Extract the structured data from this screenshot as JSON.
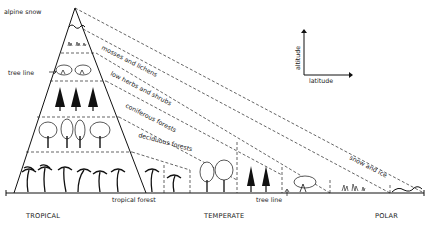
{
  "diagram": {
    "title_labels": {
      "peak": "alpine snow",
      "tree_line_left": "tree line",
      "tree_line_bottom": "tree line",
      "ground_label": "tropical forest"
    },
    "zones": [
      {
        "label": "mosses and lichens"
      },
      {
        "label": "low herbs and shrubs"
      },
      {
        "label": "coniferous forests"
      },
      {
        "label": "deciduous forests"
      },
      {
        "label": "snow and ice"
      }
    ],
    "latitude_regions": [
      {
        "label": "TROPICAL"
      },
      {
        "label": "TEMPERATE"
      },
      {
        "label": "POLAR"
      }
    ],
    "axes_key": {
      "y_label": "altitude",
      "x_label": "latitude"
    }
  }
}
